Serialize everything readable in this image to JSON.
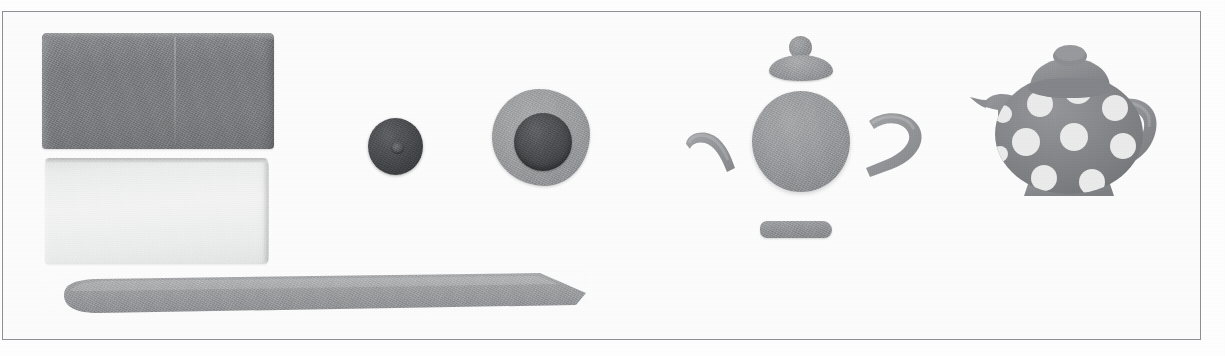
{
  "figure": {
    "frame_color": "#8e9095",
    "background_color": "#ffffff",
    "width": 1225,
    "height": 356
  },
  "objects": [
    {
      "id": "dark-clay-block",
      "label": "Dark gray clay block",
      "color": "#7a7c7f",
      "x": 42,
      "y": 33,
      "width": 232,
      "height": 116
    },
    {
      "id": "light-clay-block",
      "label": "White clay block",
      "color": "#f0f0f0",
      "x": 45,
      "y": 158,
      "width": 223,
      "height": 106
    },
    {
      "id": "clay-blade",
      "label": "Clay blade tool",
      "color": "#9b9d9f",
      "x": 40,
      "y": 271,
      "width": 546,
      "height": 46
    },
    {
      "id": "small-dark-ball",
      "label": "Small dark clay ball",
      "color": "#44464a",
      "x": 368,
      "y": 118,
      "width": 55,
      "height": 57
    },
    {
      "id": "gray-clay-pad",
      "label": "Flattened gray clay pad",
      "color": "#9a9c9e",
      "x": 492,
      "y": 89,
      "width": 98,
      "height": 97
    },
    {
      "id": "dark-clay-disc",
      "label": "Dark clay disc on pad",
      "color": "#47494c",
      "x": 514,
      "y": 113,
      "width": 58,
      "height": 58
    },
    {
      "id": "teapot-knob",
      "label": "Teapot lid knob",
      "color": "#8d8f92",
      "x": 789,
      "y": 36,
      "width": 23,
      "height": 23
    },
    {
      "id": "teapot-lid",
      "label": "Teapot lid disc",
      "color": "#97999c",
      "x": 769,
      "y": 55,
      "width": 64,
      "height": 26
    },
    {
      "id": "teapot-spout-piece",
      "label": "Teapot spout piece",
      "color": "#8f9194",
      "x": 683,
      "y": 128,
      "width": 58,
      "height": 46
    },
    {
      "id": "teapot-body-ball",
      "label": "Teapot body ball",
      "color": "#94969a",
      "x": 752,
      "y": 91,
      "width": 98,
      "height": 101
    },
    {
      "id": "teapot-handle-piece",
      "label": "Teapot handle piece",
      "color": "#8f9194",
      "x": 862,
      "y": 111,
      "width": 66,
      "height": 71
    },
    {
      "id": "teapot-base-bar",
      "label": "Teapot base bar",
      "color": "#8e9093",
      "x": 760,
      "y": 221,
      "width": 72,
      "height": 17
    },
    {
      "id": "finished-teapot",
      "label": "Finished polka dot teapot",
      "color": "#7f8184",
      "dot_color": "#ebebeb",
      "x": 966,
      "y": 42,
      "width": 196,
      "height": 160
    }
  ],
  "finished_teapot": {
    "dots": [
      {
        "cx": 74,
        "cy": 62,
        "r": 13
      },
      {
        "cx": 112,
        "cy": 48,
        "r": 14
      },
      {
        "cx": 149,
        "cy": 66,
        "r": 13
      },
      {
        "cx": 60,
        "cy": 100,
        "r": 14
      },
      {
        "cx": 108,
        "cy": 95,
        "r": 14
      },
      {
        "cx": 157,
        "cy": 104,
        "r": 13
      },
      {
        "cx": 78,
        "cy": 136,
        "r": 13
      },
      {
        "cx": 126,
        "cy": 140,
        "r": 13
      },
      {
        "cx": 37,
        "cy": 72,
        "r": 9
      },
      {
        "cx": 34,
        "cy": 112,
        "r": 8
      }
    ]
  }
}
